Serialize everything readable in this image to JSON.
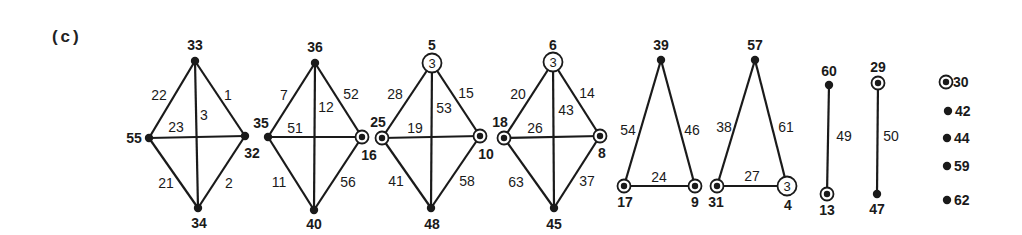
{
  "figure": {
    "caption": "(c)",
    "components": [
      {
        "id": "diamond-1",
        "nodes": [
          {
            "label": "33",
            "x": 195,
            "y": 61,
            "type": "dot",
            "lx": 195,
            "ly": 50
          },
          {
            "label": "55",
            "x": 149,
            "y": 138,
            "type": "dot",
            "lx": 134,
            "ly": 143
          },
          {
            "label": "32",
            "x": 245,
            "y": 136,
            "type": "dot",
            "lx": 252,
            "ly": 158
          },
          {
            "label": "34",
            "x": 198,
            "y": 208,
            "type": "dot",
            "lx": 199,
            "ly": 228
          }
        ],
        "edges": [
          {
            "from": 0,
            "to": 1,
            "label": "22",
            "lx": 159,
            "ly": 100
          },
          {
            "from": 0,
            "to": 2,
            "label": "1",
            "lx": 228,
            "ly": 100
          },
          {
            "from": 0,
            "to": 3,
            "label": "3",
            "lx": 204,
            "ly": 120
          },
          {
            "from": 1,
            "to": 2,
            "label": "23",
            "lx": 176,
            "ly": 132
          },
          {
            "from": 1,
            "to": 3,
            "label": "21",
            "lx": 166,
            "ly": 188
          },
          {
            "from": 2,
            "to": 3,
            "label": "2",
            "lx": 229,
            "ly": 188
          }
        ]
      },
      {
        "id": "diamond-2",
        "nodes": [
          {
            "label": "36",
            "x": 315,
            "y": 63,
            "type": "dot",
            "lx": 315,
            "ly": 52
          },
          {
            "label": "35",
            "x": 268,
            "y": 137,
            "type": "dot",
            "lx": 261,
            "ly": 128
          },
          {
            "label": "16",
            "x": 362,
            "y": 137,
            "type": "double",
            "lx": 369,
            "ly": 160
          },
          {
            "label": "40",
            "x": 314,
            "y": 210,
            "type": "dot",
            "lx": 314,
            "ly": 229
          }
        ],
        "edges": [
          {
            "from": 0,
            "to": 1,
            "label": "7",
            "lx": 284,
            "ly": 100
          },
          {
            "from": 0,
            "to": 2,
            "label": "52",
            "lx": 351,
            "ly": 99
          },
          {
            "from": 0,
            "to": 3,
            "label": "12",
            "lx": 326,
            "ly": 112
          },
          {
            "from": 1,
            "to": 2,
            "label": "51",
            "lx": 295,
            "ly": 133
          },
          {
            "from": 1,
            "to": 3,
            "label": "11",
            "lx": 279,
            "ly": 187
          },
          {
            "from": 2,
            "to": 3,
            "label": "56",
            "lx": 348,
            "ly": 187
          }
        ]
      },
      {
        "id": "diamond-3",
        "nodes": [
          {
            "label": "5",
            "x": 432,
            "y": 63,
            "type": "circle3",
            "lx": 432,
            "ly": 50
          },
          {
            "label": "25",
            "x": 382,
            "y": 138,
            "type": "double",
            "lx": 378,
            "ly": 127
          },
          {
            "label": "10",
            "x": 480,
            "y": 136,
            "type": "double",
            "lx": 486,
            "ly": 159
          },
          {
            "label": "48",
            "x": 431,
            "y": 208,
            "type": "dot",
            "lx": 432,
            "ly": 229
          }
        ],
        "edges": [
          {
            "from": 0,
            "to": 1,
            "label": "28",
            "lx": 395,
            "ly": 99
          },
          {
            "from": 0,
            "to": 2,
            "label": "15",
            "lx": 466,
            "ly": 98
          },
          {
            "from": 0,
            "to": 3,
            "label": "53",
            "lx": 444,
            "ly": 113
          },
          {
            "from": 1,
            "to": 2,
            "label": "19",
            "lx": 415,
            "ly": 133
          },
          {
            "from": 1,
            "to": 3,
            "label": "41",
            "lx": 396,
            "ly": 186
          },
          {
            "from": 2,
            "to": 3,
            "label": "58",
            "lx": 467,
            "ly": 186
          }
        ]
      },
      {
        "id": "diamond-4",
        "nodes": [
          {
            "label": "6",
            "x": 553,
            "y": 62,
            "type": "circle3",
            "lx": 553,
            "ly": 50
          },
          {
            "label": "18",
            "x": 504,
            "y": 138,
            "type": "double",
            "lx": 500,
            "ly": 127
          },
          {
            "label": "8",
            "x": 600,
            "y": 136,
            "type": "double",
            "lx": 602,
            "ly": 158
          },
          {
            "label": "45",
            "x": 554,
            "y": 208,
            "type": "dot",
            "lx": 554,
            "ly": 229
          }
        ],
        "edges": [
          {
            "from": 0,
            "to": 1,
            "label": "20",
            "lx": 518,
            "ly": 99
          },
          {
            "from": 0,
            "to": 2,
            "label": "14",
            "lx": 587,
            "ly": 98
          },
          {
            "from": 0,
            "to": 3,
            "label": "43",
            "lx": 566,
            "ly": 115
          },
          {
            "from": 1,
            "to": 2,
            "label": "26",
            "lx": 535,
            "ly": 133
          },
          {
            "from": 1,
            "to": 3,
            "label": "63",
            "lx": 516,
            "ly": 187
          },
          {
            "from": 2,
            "to": 3,
            "label": "37",
            "lx": 587,
            "ly": 186
          }
        ]
      },
      {
        "id": "triangle-1",
        "nodes": [
          {
            "label": "39",
            "x": 661,
            "y": 60,
            "type": "dot",
            "lx": 661,
            "ly": 50
          },
          {
            "label": "17",
            "x": 624,
            "y": 186,
            "type": "double",
            "lx": 625,
            "ly": 207
          },
          {
            "label": "9",
            "x": 695,
            "y": 186,
            "type": "double",
            "lx": 695,
            "ly": 207
          }
        ],
        "edges": [
          {
            "from": 0,
            "to": 1,
            "label": "54",
            "lx": 628,
            "ly": 135
          },
          {
            "from": 0,
            "to": 2,
            "label": "46",
            "lx": 692,
            "ly": 135
          },
          {
            "from": 1,
            "to": 2,
            "label": "24",
            "lx": 659,
            "ly": 182
          }
        ]
      },
      {
        "id": "triangle-2",
        "nodes": [
          {
            "label": "57",
            "x": 755,
            "y": 60,
            "type": "dot",
            "lx": 755,
            "ly": 50
          },
          {
            "label": "31",
            "x": 717,
            "y": 186,
            "type": "double",
            "lx": 716,
            "ly": 207
          },
          {
            "label": "4",
            "x": 787,
            "y": 186,
            "type": "circle3",
            "lx": 788,
            "ly": 210
          }
        ],
        "edges": [
          {
            "from": 0,
            "to": 1,
            "label": "38",
            "lx": 724,
            "ly": 132
          },
          {
            "from": 0,
            "to": 2,
            "label": "61",
            "lx": 786,
            "ly": 132
          },
          {
            "from": 1,
            "to": 2,
            "label": "27",
            "lx": 752,
            "ly": 181
          }
        ]
      },
      {
        "id": "segment-1",
        "nodes": [
          {
            "label": "60",
            "x": 829,
            "y": 85,
            "type": "dot",
            "lx": 829,
            "ly": 76
          },
          {
            "label": "13",
            "x": 827,
            "y": 194,
            "type": "double",
            "lx": 827,
            "ly": 215
          }
        ],
        "edges": [
          {
            "from": 0,
            "to": 1,
            "label": "49",
            "lx": 844,
            "ly": 141
          }
        ]
      },
      {
        "id": "segment-2",
        "nodes": [
          {
            "label": "29",
            "x": 878,
            "y": 83,
            "type": "double",
            "lx": 878,
            "ly": 72
          },
          {
            "label": "47",
            "x": 877,
            "y": 194,
            "type": "dot",
            "lx": 877,
            "ly": 214
          }
        ],
        "edges": [
          {
            "from": 0,
            "to": 1,
            "label": "50",
            "lx": 891,
            "ly": 141
          }
        ]
      }
    ],
    "isolated": [
      {
        "label": "30",
        "x": 946,
        "y": 82,
        "type": "double"
      },
      {
        "label": "42",
        "x": 948,
        "y": 111,
        "type": "dot"
      },
      {
        "label": "44",
        "x": 947,
        "y": 138,
        "type": "dot"
      },
      {
        "label": "59",
        "x": 947,
        "y": 166,
        "type": "dot"
      },
      {
        "label": "62",
        "x": 947,
        "y": 200,
        "type": "dot"
      }
    ],
    "circle_inner_text": "3"
  }
}
